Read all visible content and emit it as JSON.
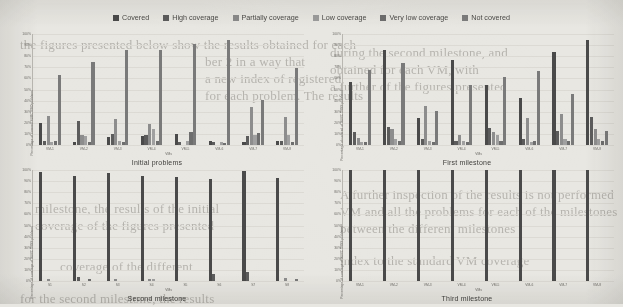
{
  "legend": {
    "items": [
      {
        "label": "Covered",
        "color": "#4a4a4a"
      },
      {
        "label": "High coverage",
        "color": "#5c5c5c"
      },
      {
        "label": "Partially coverage",
        "color": "#8a8a8a"
      },
      {
        "label": "Low coverage",
        "color": "#9c9c9c"
      },
      {
        "label": "Very low coverage",
        "color": "#6e6e6e"
      },
      {
        "label": "Not covered",
        "color": "#7d7d7d"
      }
    ]
  },
  "axis": {
    "yticks": [
      "100%",
      "90%",
      "80%",
      "70%",
      "60%",
      "50%",
      "40%",
      "30%",
      "20%",
      "10%",
      "0%"
    ],
    "xlabel": "VMs"
  },
  "series_colors": {
    "covered": "#4a4a4a",
    "high": "#5c5c5c",
    "partially": "#8d8d8d",
    "low": "#a0a0a0",
    "very_low": "#6e6e6e",
    "not_covered": "#7a7a7a"
  },
  "chart_data": [
    {
      "type": "bar",
      "id": "initial-problems",
      "title": "Initial problems",
      "xlabel": "VMs",
      "ylabel": "Percentage of covered SUBC BSO problems",
      "ylim": [
        0,
        100
      ],
      "grid": true,
      "legend_position": "top",
      "categories": [
        "VM-1",
        "VM-2",
        "VM-3",
        "VM-4",
        "VM-5",
        "VM-6",
        "VM-7",
        "VM-8"
      ],
      "series": [
        {
          "name": "Covered",
          "values": [
            20,
            3,
            7,
            8,
            10,
            4,
            3,
            4
          ]
        },
        {
          "name": "High coverage",
          "values": [
            4,
            22,
            10,
            9,
            3,
            3,
            8,
            4
          ]
        },
        {
          "name": "Partially coverage",
          "values": [
            26,
            9,
            23,
            19,
            0,
            0,
            34,
            25
          ]
        },
        {
          "name": "Low coverage",
          "values": [
            3,
            8,
            4,
            14,
            4,
            3,
            9,
            9
          ]
        },
        {
          "name": "Very low coverage",
          "values": [
            4,
            3,
            3,
            4,
            12,
            2,
            11,
            3
          ]
        },
        {
          "name": "Not covered",
          "values": [
            63,
            75,
            86,
            86,
            91,
            95,
            41,
            69
          ]
        }
      ]
    },
    {
      "type": "bar",
      "id": "first-milestone",
      "title": "First milestone",
      "xlabel": "VMs",
      "ylabel": "Percentage of covered of SUBC TVSS problems",
      "ylim": [
        0,
        100
      ],
      "grid": true,
      "legend_position": "top",
      "categories": [
        "VM-1",
        "VM-2",
        "VM-3",
        "VM-4",
        "VM-5",
        "VM-6",
        "VM-7",
        "VM-8"
      ],
      "series": [
        {
          "name": "Covered",
          "values": [
            57,
            86,
            24,
            77,
            54,
            42,
            84,
            95
          ]
        },
        {
          "name": "High coverage",
          "values": [
            12,
            16,
            5,
            4,
            15,
            5,
            13,
            25
          ]
        },
        {
          "name": "Partially coverage",
          "values": [
            6,
            14,
            35,
            9,
            12,
            24,
            28,
            14
          ]
        },
        {
          "name": "Low coverage",
          "values": [
            3,
            5,
            4,
            4,
            9,
            3,
            5,
            5
          ]
        },
        {
          "name": "Very low coverage",
          "values": [
            3,
            4,
            3,
            3,
            4,
            4,
            4,
            4
          ]
        },
        {
          "name": "Not covered",
          "values": [
            68,
            74,
            31,
            54,
            61,
            67,
            46,
            13
          ]
        }
      ]
    },
    {
      "type": "bar",
      "id": "second-milestone",
      "title": "Second milestone",
      "xlabel": "VMs",
      "ylabel": "Percentage of coverage of SUBC TVSS problems",
      "ylim": [
        0,
        100
      ],
      "grid": true,
      "legend_position": "top",
      "categories": [
        "S1",
        "S2",
        "S3",
        "S4",
        "S5",
        "S6",
        "S7",
        "S8"
      ],
      "series": [
        {
          "name": "Covered",
          "values": [
            98,
            95,
            97,
            95,
            94,
            92,
            99,
            93
          ]
        },
        {
          "name": "High coverage",
          "values": [
            0,
            4,
            0,
            0,
            0,
            6,
            8,
            0
          ]
        },
        {
          "name": "Partially coverage",
          "values": [
            2,
            0,
            2,
            2,
            0,
            0,
            0,
            3
          ]
        },
        {
          "name": "Low coverage",
          "values": [
            0,
            0,
            0,
            2,
            0,
            0,
            0,
            0
          ]
        },
        {
          "name": "Very low coverage",
          "values": [
            0,
            2,
            0,
            0,
            0,
            0,
            0,
            0
          ]
        },
        {
          "name": "Not covered",
          "values": [
            0,
            0,
            0,
            0,
            0,
            0,
            0,
            2
          ]
        }
      ]
    },
    {
      "type": "bar",
      "id": "third-milestone",
      "title": "Third milestone",
      "xlabel": "VMs",
      "ylabel": "Percentage of coverage of SUBC TVSS problems",
      "ylim": [
        0,
        100
      ],
      "grid": true,
      "legend_position": "top",
      "categories": [
        "VM-1",
        "VM-2",
        "VM-3",
        "VM-4",
        "VM-5",
        "VM-6",
        "VM-7",
        "VM-8"
      ],
      "series": [
        {
          "name": "Covered",
          "values": [
            100,
            100,
            100,
            100,
            100,
            100,
            100,
            100
          ]
        },
        {
          "name": "High coverage",
          "values": [
            0,
            0,
            0,
            0,
            0,
            0,
            0,
            0
          ]
        },
        {
          "name": "Partially coverage",
          "values": [
            0,
            0,
            0,
            0,
            0,
            0,
            0,
            0
          ]
        },
        {
          "name": "Low coverage",
          "values": [
            0,
            0,
            0,
            0,
            0,
            0,
            0,
            0
          ]
        },
        {
          "name": "Very low coverage",
          "values": [
            0,
            0,
            0,
            0,
            0,
            0,
            0,
            0
          ]
        },
        {
          "name": "Not covered",
          "values": [
            0,
            0,
            0,
            0,
            0,
            0,
            0,
            0
          ]
        }
      ]
    }
  ],
  "background_text": {
    "lines": [
      {
        "x": 20,
        "y": 36,
        "text": "the figures presented below show the results obtained for each"
      },
      {
        "x": 205,
        "y": 53,
        "text": "ber 2 in a way that"
      },
      {
        "x": 205,
        "y": 70,
        "text": "a new index of registered"
      },
      {
        "x": 205,
        "y": 87,
        "text": "for each problem. The results"
      },
      {
        "x": 330,
        "y": 44,
        "text": "during the second milestone, and"
      },
      {
        "x": 330,
        "y": 61,
        "text": "obtained for each VM, with"
      },
      {
        "x": 330,
        "y": 78,
        "text": "a further of the figures presented"
      },
      {
        "x": 35,
        "y": 200,
        "text": "milestone, the results of the initial"
      },
      {
        "x": 35,
        "y": 217,
        "text": "coverage of the figures presented"
      },
      {
        "x": 340,
        "y": 186,
        "text": "A further inspection of the results is not performed"
      },
      {
        "x": 340,
        "y": 203,
        "text": "VM and all the problems for each of the milestones"
      },
      {
        "x": 340,
        "y": 220,
        "text": "between the different milestones"
      },
      {
        "x": 60,
        "y": 258,
        "text": "coverage of the different"
      },
      {
        "x": 340,
        "y": 252,
        "text": "index to the standard VM coverage"
      },
      {
        "x": 20,
        "y": 290,
        "text": "for the second milestone, the results"
      }
    ]
  }
}
